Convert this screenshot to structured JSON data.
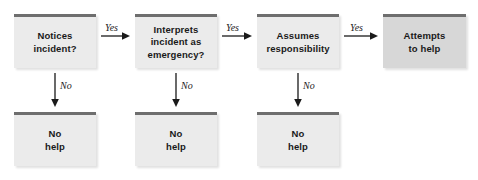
{
  "diagram": {
    "colors": {
      "box_fill": "#ebebeb",
      "box_fill_final": "#d7d7d7",
      "box_top_bar": "#6e6e6e",
      "text": "#1a1a1a",
      "arrow": "#1a1a1a",
      "background": "#ffffff"
    },
    "nodes": [
      {
        "id": "notices",
        "label": "Notices\nincident?",
        "x": 14,
        "y": 14,
        "w": 82,
        "h": 54,
        "variant": "light"
      },
      {
        "id": "interprets",
        "label": "Interprets\nincident as\nemergency?",
        "x": 135,
        "y": 14,
        "w": 82,
        "h": 54,
        "variant": "light"
      },
      {
        "id": "assumes",
        "label": "Assumes\nresponsibility",
        "x": 257,
        "y": 14,
        "w": 82,
        "h": 54,
        "variant": "light"
      },
      {
        "id": "attempts",
        "label": "Attempts\nto help",
        "x": 383,
        "y": 14,
        "w": 83,
        "h": 54,
        "variant": "dark"
      },
      {
        "id": "no-help-1",
        "label": "No\nhelp",
        "x": 14,
        "y": 112,
        "w": 82,
        "h": 54,
        "variant": "light"
      },
      {
        "id": "no-help-2",
        "label": "No\nhelp",
        "x": 135,
        "y": 112,
        "w": 82,
        "h": 54,
        "variant": "light"
      },
      {
        "id": "no-help-3",
        "label": "No\nhelp",
        "x": 257,
        "y": 112,
        "w": 82,
        "h": 54,
        "variant": "light"
      }
    ],
    "edges": [
      {
        "id": "yes-1",
        "label": "Yes",
        "from": "notices",
        "to": "interprets",
        "orientation": "horizontal",
        "x": 101,
        "y": 36,
        "length": 29,
        "label_x": 105,
        "label_y": 22
      },
      {
        "id": "yes-2",
        "label": "Yes",
        "from": "interprets",
        "to": "assumes",
        "orientation": "horizontal",
        "x": 222,
        "y": 36,
        "length": 30,
        "label_x": 226,
        "label_y": 22
      },
      {
        "id": "yes-3",
        "label": "Yes",
        "from": "assumes",
        "to": "attempts",
        "orientation": "horizontal",
        "x": 344,
        "y": 36,
        "length": 34,
        "label_x": 350,
        "label_y": 22
      },
      {
        "id": "no-1",
        "label": "No",
        "from": "notices",
        "to": "no-help-1",
        "orientation": "vertical",
        "x": 55,
        "y": 73,
        "length": 34,
        "label_x": 60,
        "label_y": 80
      },
      {
        "id": "no-2",
        "label": "No",
        "from": "interprets",
        "to": "no-help-2",
        "orientation": "vertical",
        "x": 176,
        "y": 73,
        "length": 34,
        "label_x": 181,
        "label_y": 80
      },
      {
        "id": "no-3",
        "label": "No",
        "from": "assumes",
        "to": "no-help-3",
        "orientation": "vertical",
        "x": 298,
        "y": 73,
        "length": 34,
        "label_x": 303,
        "label_y": 80
      }
    ]
  }
}
